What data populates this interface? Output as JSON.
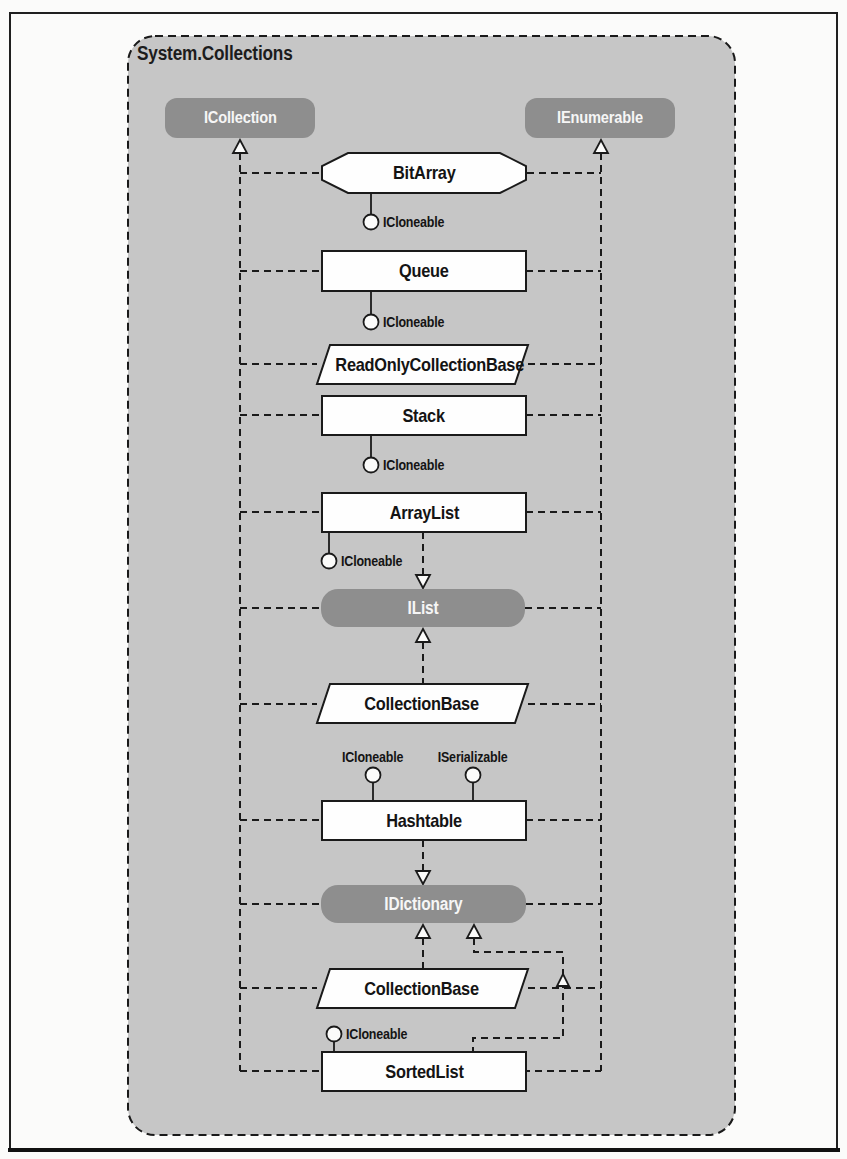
{
  "namespace_label": "System.Collections",
  "interfaces": {
    "icollection": "ICollection",
    "ienumerable": "IEnumerable",
    "ilist": "IList",
    "idictionary": "IDictionary"
  },
  "classes": {
    "bitarray": "BitArray",
    "queue": "Queue",
    "readonly_collection_base": "ReadOnlyCollectionBase",
    "stack": "Stack",
    "arraylist": "ArrayList",
    "collection_base_upper": "CollectionBase",
    "hashtable": "Hashtable",
    "collection_base_lower": "CollectionBase",
    "sortedlist": "SortedList"
  },
  "lollipop_interfaces": {
    "bitarray_cloneable": "ICloneable",
    "queue_cloneable": "ICloneable",
    "stack_cloneable": "ICloneable",
    "arraylist_cloneable": "ICloneable",
    "hashtable_cloneable": "ICloneable",
    "hashtable_serializable": "ISerializable",
    "sortedlist_cloneable": "ICloneable"
  },
  "colors": {
    "container_fill": "#c6c6c6",
    "interface_pill_fill": "#8e8e8e",
    "class_box_fill": "#fefefe",
    "line": "#1a1a1a",
    "pill_text": "#f6f6f6"
  }
}
